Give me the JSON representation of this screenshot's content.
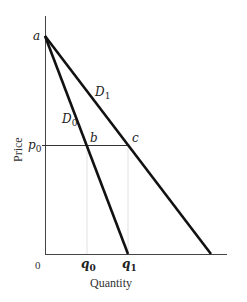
{
  "diagram": {
    "axes": {
      "ylabel": "Price",
      "xlabel": "Quantity",
      "origin": "0"
    },
    "points": {
      "a": "a",
      "b": "b",
      "c": "c"
    },
    "curves": [
      {
        "name": "D0",
        "label_main": "D",
        "label_sub": "0"
      },
      {
        "name": "D1",
        "label_main": "D",
        "label_sub": "1"
      }
    ],
    "price_level": {
      "label_main": "p",
      "label_sub": "0"
    },
    "quantities": [
      {
        "label_main": "q",
        "label_sub": "0"
      },
      {
        "label_main": "q",
        "label_sub": "1"
      }
    ]
  },
  "colors": {
    "line": "#111111",
    "axis": "#444444",
    "guide": "#dddddd"
  }
}
